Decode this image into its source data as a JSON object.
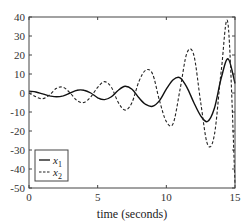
{
  "chart_data": {
    "type": "line",
    "title": "",
    "xlabel": "time (seconds)",
    "ylabel": "",
    "xlim": [
      0,
      15
    ],
    "ylim": [
      -50,
      40
    ],
    "xticks": [
      0,
      5,
      10,
      15
    ],
    "yticks": [
      40,
      30,
      20,
      10,
      0,
      -10,
      -20,
      -30,
      -40,
      -50
    ],
    "grid": false,
    "legend_position": "lower left",
    "series": [
      {
        "name": "x1",
        "style": "solid",
        "color": "#111111",
        "x": [
          0,
          0.5,
          1.0,
          1.5,
          2.0,
          2.5,
          3.0,
          3.5,
          4.0,
          4.5,
          5.0,
          5.5,
          6.0,
          6.5,
          7.0,
          7.5,
          8.0,
          8.5,
          9.0,
          9.5,
          10.0,
          10.5,
          11.0,
          11.5,
          12.0,
          12.5,
          13.0,
          13.5,
          14.0,
          14.5,
          15.0
        ],
        "values": [
          1,
          0.5,
          -0.5,
          -1.5,
          -2,
          -1.5,
          0,
          1.5,
          1.5,
          0,
          -2.5,
          -3.5,
          -2,
          1.5,
          3.5,
          2,
          -2.5,
          -6,
          -7,
          -4,
          2,
          7,
          8,
          3,
          -5,
          -12,
          -15,
          -8,
          8,
          18,
          5
        ]
      },
      {
        "name": "x2",
        "style": "dashed",
        "color": "#222222",
        "x": [
          0,
          0.5,
          1.0,
          1.5,
          2.0,
          2.5,
          3.0,
          3.5,
          4.0,
          4.5,
          5.0,
          5.5,
          6.0,
          6.5,
          7.0,
          7.5,
          8.0,
          8.5,
          9.0,
          9.5,
          10.0,
          10.5,
          11.0,
          11.5,
          12.0,
          12.5,
          13.0,
          13.5,
          14.0,
          14.5,
          15.0
        ],
        "values": [
          0,
          -2,
          -3,
          -1,
          2.5,
          3,
          0,
          -4,
          -5,
          -2,
          3,
          6,
          3,
          -5,
          -9,
          -5,
          6,
          12,
          10,
          -4,
          -15,
          -16,
          2,
          21,
          20,
          -5,
          -27,
          -22,
          12,
          36,
          -48
        ]
      }
    ],
    "legend": [
      {
        "label": "x",
        "sub": "1",
        "style": "solid"
      },
      {
        "label": "x",
        "sub": "2",
        "style": "dashed"
      }
    ]
  }
}
